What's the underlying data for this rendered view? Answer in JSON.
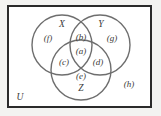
{
  "figure": {
    "kind": "venn-diagram",
    "frame_color": "#2b2b2b",
    "circle_color": "#6e6e6e",
    "background_color": "#ffffff",
    "page_background": "#f3f3f1",
    "text_color": "#3a3a3a"
  },
  "sets": [
    {
      "id": "X",
      "label": "X",
      "label_x": 62,
      "label_y": 25,
      "cx": 62,
      "cy": 45,
      "r": 30
    },
    {
      "id": "Y",
      "label": "Y",
      "label_x": 101,
      "label_y": 25,
      "cx": 100,
      "cy": 45,
      "r": 30
    },
    {
      "id": "Z",
      "label": "Z",
      "label_x": 81,
      "label_y": 89,
      "cx": 81,
      "cy": 70,
      "r": 30
    }
  ],
  "universe": {
    "label": "U",
    "label_x": 20,
    "label_y": 98
  },
  "regions": [
    {
      "id": "a",
      "label": "(a)",
      "meaning": "X and Y and Z",
      "x": 81,
      "y": 51
    },
    {
      "id": "b",
      "label": "(b)",
      "meaning": "X and Y only",
      "x": 81,
      "y": 37
    },
    {
      "id": "c",
      "label": "(c)",
      "meaning": "X and Z only",
      "x": 64,
      "y": 62
    },
    {
      "id": "d",
      "label": "(d)",
      "meaning": "Y and Z only",
      "x": 98,
      "y": 62
    },
    {
      "id": "e",
      "label": "(e)",
      "meaning": "Z only",
      "x": 81,
      "y": 76
    },
    {
      "id": "f",
      "label": "(f)",
      "meaning": "X only",
      "x": 48,
      "y": 38
    },
    {
      "id": "g",
      "label": "(g)",
      "meaning": "Y only",
      "x": 112,
      "y": 38
    },
    {
      "id": "h",
      "label": "(h)",
      "meaning": "outside all sets",
      "x": 129,
      "y": 84
    }
  ]
}
